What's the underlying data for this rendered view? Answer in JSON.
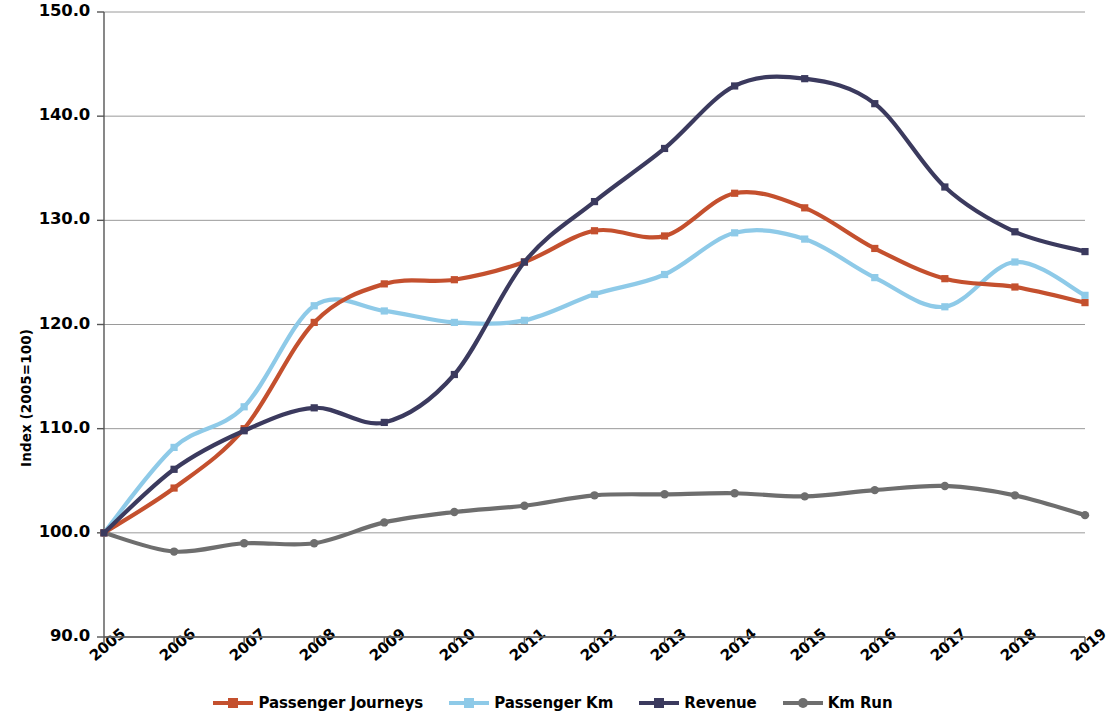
{
  "chart_data": {
    "type": "line",
    "title": "",
    "subtitle": "",
    "xlabel": "",
    "ylabel": "Index (2005=100)",
    "x": [
      2005,
      2006,
      2007,
      2008,
      2009,
      2010,
      2011,
      2012,
      2013,
      2014,
      2015,
      2016,
      2017,
      2018,
      2019
    ],
    "categories": [
      "2005",
      "2006",
      "2007",
      "2008",
      "2009",
      "2010",
      "2011",
      "2012",
      "2013",
      "2014",
      "2015",
      "2016",
      "2017",
      "2018",
      "2019"
    ],
    "xlim": [
      2005,
      2019
    ],
    "ylim": [
      90.0,
      150.0
    ],
    "ytick_labels": [
      "150.0",
      "140.0",
      "130.0",
      "120.0",
      "110.0",
      "100.0",
      "90.0"
    ],
    "ytick_values": [
      150.0,
      140.0,
      130.0,
      120.0,
      110.0,
      100.0,
      90.0
    ],
    "ystep": 10.0,
    "grid": true,
    "grid_axis": "y",
    "legend_position": "bottom",
    "smoothing": "spline",
    "markers": true,
    "series": [
      {
        "name": "Passenger Journeys",
        "color": "#C4502E",
        "values": [
          100.0,
          104.3,
          110.0,
          120.2,
          123.9,
          124.3,
          126.0,
          129.0,
          128.5,
          132.6,
          131.2,
          127.3,
          124.4,
          123.6,
          122.1
        ]
      },
      {
        "name": "Passenger Km",
        "color": "#8ECAE8",
        "values": [
          100.0,
          108.2,
          112.1,
          121.8,
          121.3,
          120.2,
          120.4,
          122.9,
          124.8,
          128.8,
          128.2,
          124.5,
          121.7,
          126.0,
          122.8
        ]
      },
      {
        "name": "Revenue",
        "color": "#3B3A5E",
        "values": [
          100.0,
          106.1,
          109.8,
          112.0,
          110.6,
          115.2,
          126.0,
          131.8,
          136.9,
          142.9,
          143.6,
          141.2,
          133.2,
          128.9,
          127.0
        ]
      },
      {
        "name": "Km Run",
        "color": "#6E6E6E",
        "values": [
          100.0,
          98.2,
          99.0,
          99.0,
          101.0,
          102.0,
          102.6,
          103.6,
          103.7,
          103.8,
          103.5,
          104.1,
          104.5,
          103.6,
          101.7
        ]
      }
    ]
  },
  "legend": {
    "items": [
      {
        "label": "Passenger Journeys",
        "color": "#C4502E"
      },
      {
        "label": "Passenger Km",
        "color": "#8ECAE8"
      },
      {
        "label": "Revenue",
        "color": "#3B3A5E"
      },
      {
        "label": "Km Run",
        "color": "#6E6E6E"
      }
    ]
  },
  "axes": {
    "y_title": "Index (2005=100)",
    "axis_color": "#555555",
    "grid_color": "#9a9a9a"
  }
}
